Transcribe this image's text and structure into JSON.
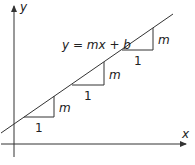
{
  "diagram": {
    "title_equation": "y = mx + b",
    "axes": {
      "x_label": "x",
      "y_label": "y"
    },
    "triangles": [
      {
        "run_label": "1",
        "rise_label": "m"
      },
      {
        "run_label": "1",
        "rise_label": "m"
      },
      {
        "run_label": "1",
        "rise_label": "m"
      }
    ],
    "colors": {
      "stroke": "#333333",
      "background": "#ffffff"
    }
  }
}
